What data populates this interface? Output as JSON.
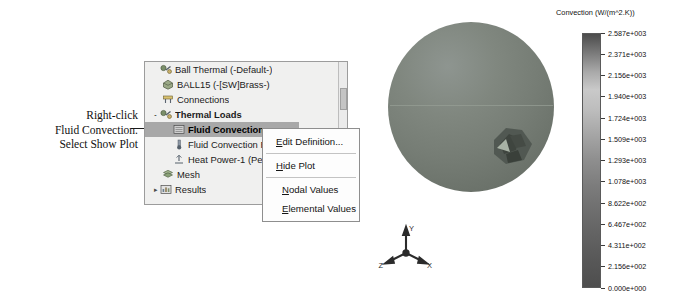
{
  "annotation": {
    "lines": [
      "Right-click",
      "Fluid Convection.",
      "Select Show Plot"
    ]
  },
  "tree": {
    "items": [
      {
        "label": "Ball Thermal (-Default-)",
        "icon": "study-icon",
        "indent": 0,
        "twisty": "",
        "bold": false,
        "selected": false
      },
      {
        "label": "BALL15 (-[SW]Brass-)",
        "icon": "solid-body-icon",
        "indent": 1,
        "twisty": "",
        "bold": false,
        "selected": false
      },
      {
        "label": "Connections",
        "icon": "connections-icon",
        "indent": 1,
        "twisty": "",
        "bold": false,
        "selected": false
      },
      {
        "label": "Thermal Loads",
        "icon": "thermal-loads-icon",
        "indent": 1,
        "twisty": "-",
        "bold": true,
        "selected": false
      },
      {
        "label": "Fluid Convection",
        "icon": "fluid-convection-icon",
        "indent": 2,
        "twisty": "",
        "bold": true,
        "selected": true
      },
      {
        "label": "Fluid Convection Ref",
        "icon": "temperature-icon",
        "indent": 2,
        "twisty": "",
        "bold": false,
        "selected": false
      },
      {
        "label": "Heat Power-1 (Per i",
        "icon": "heat-power-icon",
        "indent": 2,
        "twisty": "",
        "bold": false,
        "selected": false
      },
      {
        "label": "Mesh",
        "icon": "mesh-icon",
        "indent": 1,
        "twisty": "",
        "bold": false,
        "selected": false
      },
      {
        "label": "Results",
        "icon": "results-icon",
        "indent": 1,
        "twisty": "▸",
        "bold": false,
        "selected": false
      }
    ]
  },
  "context_menu": {
    "groups": [
      [
        {
          "label": "Edit Definition...",
          "accel": "E"
        }
      ],
      [
        {
          "label": "Hide Plot",
          "accel": "H"
        }
      ],
      [
        {
          "label": "Nodal Values",
          "accel": "N"
        },
        {
          "label": "Elemental Values",
          "accel": "E"
        }
      ]
    ]
  },
  "viewport": {
    "triad": {
      "x_label": "X",
      "y_label": "Y",
      "z_label": "Z"
    }
  },
  "chart_data": {
    "type": "heatmap",
    "title": "Convection (W/(m^2.K))",
    "colormap": "grayscale",
    "legend_position": "right",
    "units": "W/(m^2.K)",
    "vmin": 0,
    "vmax": 2587,
    "tick_labels": [
      "2.587e+003",
      "2.371e+003",
      "2.156e+003",
      "1.940e+003",
      "1.724e+003",
      "1.509e+003",
      "1.293e+003",
      "1.078e+003",
      "8.622e+002",
      "6.467e+002",
      "4.311e+002",
      "2.156e+002",
      "0.000e+000"
    ],
    "tick_values": [
      2587,
      2371,
      2156,
      1940,
      1724,
      1509,
      1293,
      1078,
      862.2,
      646.7,
      431.1,
      215.6,
      0
    ]
  }
}
